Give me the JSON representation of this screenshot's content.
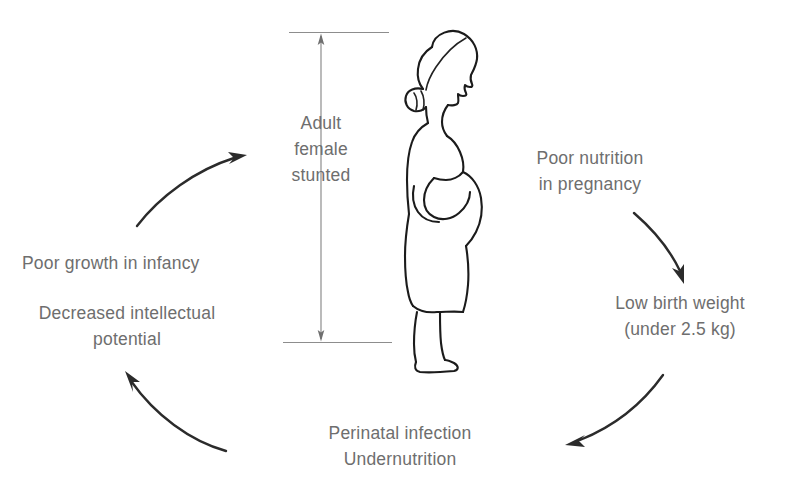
{
  "diagram": {
    "type": "cycle-diagram",
    "text_color": "#6e6e6e",
    "line_color": "#2b2b2b",
    "measure_color": "#8d8d8d",
    "background": "#ffffff",
    "nodes": [
      {
        "id": "adult-female-stunted",
        "label": "Adult\nfemale\nstunted",
        "position": "center"
      },
      {
        "id": "poor-nutrition-in-pregnancy",
        "label": "Poor nutrition\nin pregnancy",
        "position": "top-right"
      },
      {
        "id": "low-birth-weight",
        "label": "Low birth weight\n(under 2.5 kg)",
        "position": "right"
      },
      {
        "id": "perinatal-infection-undernutrition",
        "label": "Perinatal infection\nUndernutrition",
        "position": "bottom"
      },
      {
        "id": "poor-growth-in-infancy",
        "label": "Poor growth in infancy",
        "position": "left-upper"
      },
      {
        "id": "decreased-intellectual-potential",
        "label": "Decreased intellectual\npotential",
        "position": "left-lower"
      }
    ],
    "arrows": [
      {
        "id": "arrow-bottom-left-up",
        "from": "decreased-intellectual-potential",
        "to": "poor-growth-in-infancy"
      },
      {
        "id": "arrow-top-left-right",
        "from": "poor-growth-in-infancy",
        "to": "adult-female-stunted"
      },
      {
        "id": "arrow-right-down",
        "from": "poor-nutrition-in-pregnancy",
        "to": "low-birth-weight"
      },
      {
        "id": "arrow-bottom-right-left",
        "from": "low-birth-weight",
        "to": "perinatal-infection-undernutrition"
      }
    ],
    "illustration": {
      "id": "pregnant-woman-figure",
      "description": "Line drawing of a stunted pregnant adult female shown in profile, facing right, with hair tied in a bun"
    },
    "measurement": {
      "id": "height-measure",
      "description": "Vertical double-headed measurement arrow spanning the height of the figure"
    }
  }
}
